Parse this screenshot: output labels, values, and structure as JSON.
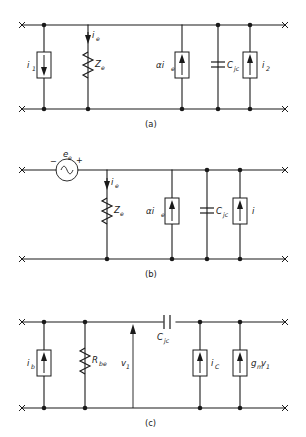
{
  "figure": {
    "background_color": "#ffffff",
    "line_color": "#1a1a1a",
    "panels": [
      {
        "id": "a",
        "caption": "(a)",
        "description": "Current-source driven equivalent circuit with emitter impedance and collector junction capacitance",
        "elements": [
          {
            "name": "current-source-i1",
            "symbol": "box-arrow-down",
            "label": "i",
            "sub": "1"
          },
          {
            "name": "resistor-ze",
            "symbol": "zigzag",
            "label": "Z",
            "sub": "e"
          },
          {
            "name": "current-arrow-ie",
            "symbol": "arrow-down",
            "label": "i",
            "sub": "e"
          },
          {
            "name": "dependent-source-alpha-ie",
            "symbol": "box-arrow-up",
            "label": "αi",
            "sub": "e"
          },
          {
            "name": "capacitor-cjc",
            "symbol": "capacitor-shunt",
            "label": "C",
            "sub": "jc"
          },
          {
            "name": "current-source-i2",
            "symbol": "box-arrow-up",
            "label": "i",
            "sub": "2"
          }
        ]
      },
      {
        "id": "b",
        "caption": "(b)",
        "description": "Voltage-source driven equivalent circuit with emitter impedance and collector junction capacitance",
        "elements": [
          {
            "name": "ac-voltage-source-ee",
            "symbol": "circle-sine",
            "label": "e",
            "sub": "e"
          },
          {
            "name": "polarity-minus",
            "symbol": "minus-sign",
            "label": "−"
          },
          {
            "name": "polarity-plus",
            "symbol": "plus-sign",
            "label": "+"
          },
          {
            "name": "current-arrow-ie",
            "symbol": "arrow-down",
            "label": "i",
            "sub": "e"
          },
          {
            "name": "resistor-ze",
            "symbol": "zigzag",
            "label": "Z",
            "sub": "e"
          },
          {
            "name": "dependent-source-alpha-ie",
            "symbol": "box-arrow-up",
            "label": "αi",
            "sub": "e"
          },
          {
            "name": "capacitor-cjc",
            "symbol": "capacitor-shunt",
            "label": "C",
            "sub": "jc"
          },
          {
            "name": "current-source-i",
            "symbol": "box-arrow-up",
            "label": "i",
            "sub": ""
          }
        ]
      },
      {
        "id": "c",
        "caption": "(c)",
        "description": "Hybrid-pi equivalent circuit with base resistance, feedback capacitance and transconductance source",
        "elements": [
          {
            "name": "current-source-ib",
            "symbol": "box-arrow-up",
            "label": "i",
            "sub": "b"
          },
          {
            "name": "resistor-rbe",
            "symbol": "zigzag",
            "label": "R",
            "sub": "be"
          },
          {
            "name": "voltage-arrow-v1",
            "symbol": "arrow-up",
            "label": "v",
            "sub": "1"
          },
          {
            "name": "capacitor-cjc-series",
            "symbol": "capacitor-series",
            "label": "C",
            "sub": "jc"
          },
          {
            "name": "current-source-ic",
            "symbol": "box-arrow-up",
            "label": "i",
            "sub": "C"
          },
          {
            "name": "dependent-source-gmv1",
            "symbol": "box-arrow-up",
            "label": "g",
            "sub": "m",
            "label2": "v",
            "sub2": "1"
          }
        ]
      }
    ]
  },
  "labels": {
    "a_i1": "i",
    "a_i1_sub": "1",
    "a_ie": "i",
    "a_ie_sub": "e",
    "a_ze": "Z",
    "a_ze_sub": "e",
    "a_alpha_ie": "αi",
    "a_alpha_ie_sub": "e",
    "a_cjc": "C",
    "a_cjc_sub": "jc",
    "a_i2": "i",
    "a_i2_sub": "2",
    "a_caption": "(a)",
    "b_minus": "−",
    "b_ee": "e",
    "b_ee_sub": "e",
    "b_plus": "+",
    "b_ie": "i",
    "b_ie_sub": "e",
    "b_ze": "Z",
    "b_ze_sub": "e",
    "b_alpha_ie": "αi",
    "b_alpha_ie_sub": "e",
    "b_cjc": "C",
    "b_cjc_sub": "jc",
    "b_i": "i",
    "b_caption": "(b)",
    "c_ib": "i",
    "c_ib_sub": "b",
    "c_rbe": "R",
    "c_rbe_sub": "be",
    "c_v1": "v",
    "c_v1_sub": "1",
    "c_cjc": "C",
    "c_cjc_sub": "jc",
    "c_ic": "i",
    "c_ic_sub": "C",
    "c_gm": "g",
    "c_gm_sub": "m",
    "c_v1b": "v",
    "c_v1b_sub": "1",
    "c_caption": "(c)"
  }
}
